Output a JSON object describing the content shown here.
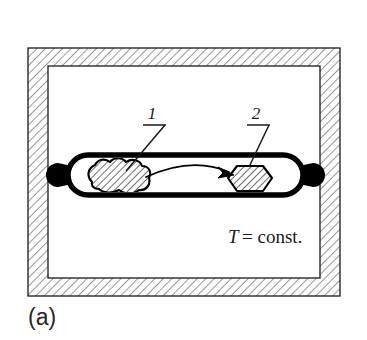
{
  "figure": {
    "caption": "(a)",
    "background_color": "#ffffff",
    "ink_color": "#000000",
    "hatch_color": "#4d4d4d"
  },
  "furnace": {
    "name": "isothermal-enclosure",
    "hatch_pattern": "diagonal-45-forward-slash",
    "outer": {
      "x": 28,
      "y": 48,
      "width": 312,
      "height": 248
    },
    "inner": {
      "x": 48,
      "y": 66,
      "width": 272,
      "height": 212
    },
    "wall_thickness_px": 20
  },
  "ampoule": {
    "name": "sealed-quartz-ampoule",
    "shape": "capsule-with-sealed-tips",
    "body": {
      "x": 68,
      "y": 155,
      "width": 235,
      "height": 40
    },
    "wall_stroke_px": 5,
    "left_tip": {
      "cx": 64,
      "cy": 175,
      "r": 8
    },
    "right_tip": {
      "cx": 307,
      "cy": 175,
      "r": 8
    }
  },
  "species": [
    {
      "id": "1",
      "label": "1",
      "name": "source-charge-polycrystalline",
      "shape": "irregular-lobed-blob",
      "hatched": true,
      "center": {
        "x": 115,
        "y": 177
      },
      "leader": {
        "x1": 162,
        "y1": 126,
        "x2": 126,
        "y2": 170
      },
      "underline": {
        "x1": 146,
        "y1": 124,
        "x2": 166,
        "y2": 124
      },
      "text_pos": {
        "x": 152,
        "y": 118
      }
    },
    {
      "id": "2",
      "label": "2",
      "name": "grown-single-crystal-hexagon",
      "shape": "regular-hexagon-flat-top",
      "hatched": true,
      "center": {
        "x": 250,
        "y": 177
      },
      "leader": {
        "x1": 265,
        "y1": 126,
        "x2": 248,
        "y2": 166
      },
      "underline": {
        "x1": 249,
        "y1": 124,
        "x2": 269,
        "y2": 124
      },
      "text_pos": {
        "x": 255,
        "y": 118
      }
    }
  ],
  "transport_arrow": {
    "name": "vapour-transport-arrow",
    "direction": "left-to-right",
    "style": "curved-arc-arrowhead",
    "start": {
      "x": 145,
      "y": 176
    },
    "control": {
      "x": 195,
      "y": 160
    },
    "end": {
      "x": 232,
      "y": 174
    }
  },
  "annotations": {
    "temperature_symbol": "T",
    "temperature_relation": "= const.",
    "temperature_full": "T = const.",
    "temperature_pos": {
      "x": 228,
      "y": 241
    }
  }
}
